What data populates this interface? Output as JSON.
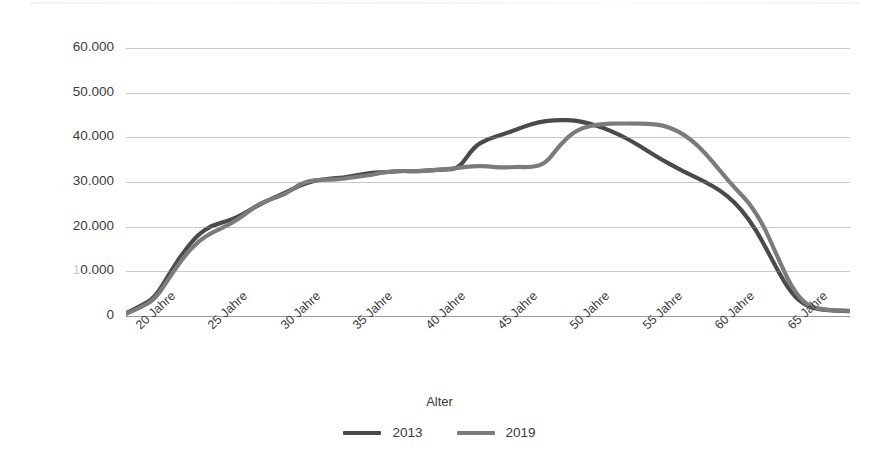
{
  "chart_data": {
    "type": "line",
    "title": "",
    "xlabel": "Alter",
    "ylabel": "Beschäftige",
    "xlim": [
      18,
      68
    ],
    "ylim": [
      0,
      60000
    ],
    "grid": true,
    "legend_position": "bottom",
    "y_ticks": [
      "0",
      "10.000",
      "20.000",
      "30.000",
      "40.000",
      "50.000",
      "60.000"
    ],
    "y_tick_values": [
      0,
      10000,
      20000,
      30000,
      40000,
      50000,
      60000
    ],
    "x_tick_labels": [
      "20 Jahre",
      "25 Jahre",
      "30 Jahre",
      "35 Jahre",
      "40 Jahre",
      "45 Jahre",
      "50 Jahre",
      "55 Jahre",
      "60 Jahre",
      "65 Jahre"
    ],
    "x_tick_values": [
      20,
      25,
      30,
      35,
      40,
      45,
      50,
      55,
      60,
      65
    ],
    "x": [
      18,
      19,
      20,
      21,
      22,
      23,
      24,
      25,
      26,
      27,
      28,
      29,
      30,
      31,
      32,
      33,
      34,
      35,
      36,
      37,
      38,
      39,
      40,
      41,
      42,
      43,
      44,
      45,
      46,
      47,
      48,
      49,
      50,
      51,
      52,
      53,
      54,
      55,
      56,
      57,
      58,
      59,
      60,
      61,
      62,
      63,
      64,
      65,
      66,
      67,
      68
    ],
    "series": [
      {
        "name": "2013",
        "color": "#4a4a4a",
        "values": [
          600,
          2200,
          4100,
          9500,
          14500,
          18300,
          20400,
          21200,
          22600,
          24600,
          26200,
          27600,
          29200,
          30300,
          30700,
          31000,
          31600,
          32100,
          32200,
          32500,
          32400,
          32600,
          32800,
          33000,
          37800,
          39700,
          40600,
          41800,
          43000,
          43700,
          43900,
          43800,
          43100,
          42100,
          40700,
          39000,
          37000,
          35000,
          33200,
          31600,
          30000,
          28200,
          25600,
          21800,
          16500,
          10200,
          4800,
          2200,
          1400,
          1200,
          1100
        ]
      },
      {
        "name": "2019",
        "color": "#7b7b7b",
        "values": [
          500,
          1900,
          3700,
          8600,
          13300,
          16800,
          18800,
          20200,
          22200,
          24800,
          26200,
          27200,
          29600,
          30500,
          30500,
          30700,
          31200,
          31600,
          32300,
          32500,
          32400,
          32600,
          32800,
          33200,
          33600,
          33500,
          33200,
          33400,
          33300,
          34100,
          38500,
          41400,
          42600,
          43000,
          43100,
          43100,
          43000,
          42800,
          41600,
          39600,
          36500,
          32600,
          28800,
          25500,
          20500,
          13200,
          6200,
          2400,
          1500,
          1250,
          1150
        ]
      }
    ]
  },
  "axis": {
    "y_title": "Beschäftige",
    "x_title": "Alter"
  },
  "legend": {
    "entries": [
      {
        "label": "2013",
        "color": "#4a4a4a"
      },
      {
        "label": "2019",
        "color": "#7b7b7b"
      }
    ]
  }
}
